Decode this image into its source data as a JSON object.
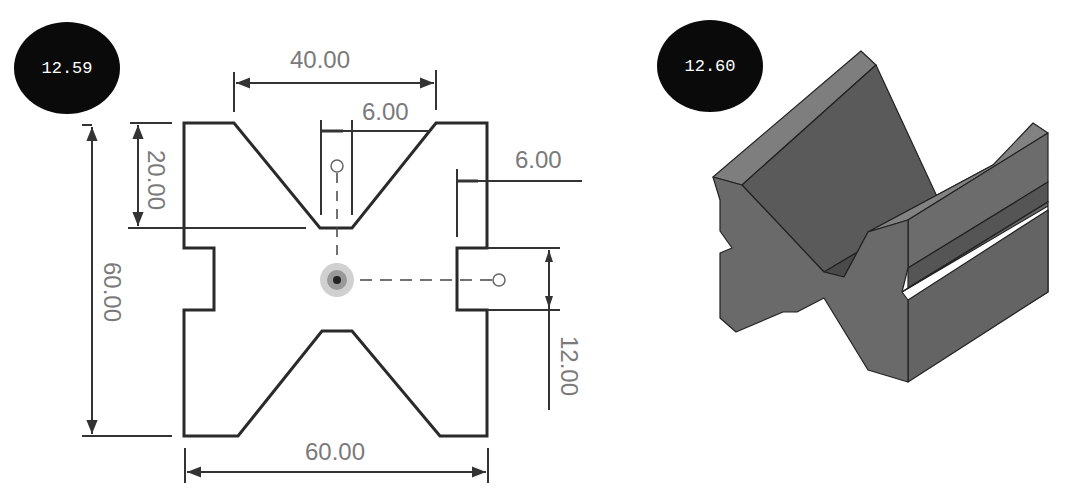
{
  "figures": [
    {
      "id": "12.59",
      "label": "12.59",
      "type": "2D dimensioned sketch",
      "dimensions": {
        "top_v_width": "40.00",
        "v_bottom_flat": "6.00",
        "right_slot_depth": "6.00",
        "v_depth": "20.00",
        "overall_height": "60.00",
        "slot_height": "12.00",
        "overall_width": "60.00"
      }
    },
    {
      "id": "12.60",
      "label": "12.60",
      "type": "3D isometric extrusion (V-block)"
    }
  ],
  "colors": {
    "badge_bg": "#0a0a0a",
    "badge_text": "#ffffff",
    "outline": "#2a2a2a",
    "dimension_text": "#7a7a7a",
    "solid_face_front": "#6e6e6e",
    "solid_face_top": "#7c7c7c",
    "solid_face_side": "#5f5f5f"
  }
}
